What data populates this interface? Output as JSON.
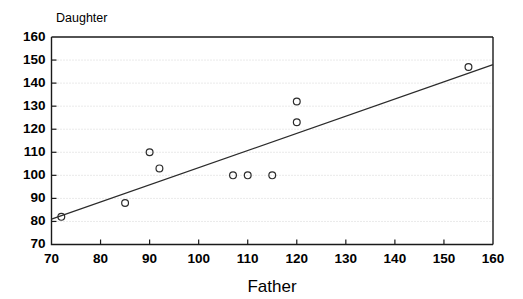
{
  "chart_data": {
    "type": "scatter",
    "title": "",
    "xlabel": "Father",
    "ylabel": "Daughter",
    "xlim": [
      70,
      160
    ],
    "ylim": [
      70,
      160
    ],
    "xticks": [
      70,
      80,
      90,
      100,
      110,
      120,
      130,
      140,
      150,
      160
    ],
    "yticks": [
      70,
      80,
      90,
      100,
      110,
      120,
      130,
      140,
      150,
      160
    ],
    "xtick_labels": [
      "70",
      "80",
      "90",
      "100",
      "110",
      "120",
      "130",
      "140",
      "150",
      "160"
    ],
    "ytick_labels": [
      "70",
      "80",
      "90",
      "100",
      "110",
      "120",
      "130",
      "140",
      "150",
      "160"
    ],
    "grid": "horizontal",
    "legend": "none",
    "marker": "open-circle",
    "marker_color": "#2b2b2b",
    "line_color": "#2b2b2b",
    "x": [
      72,
      85,
      90,
      92,
      107,
      110,
      115,
      120,
      120,
      155
    ],
    "y": [
      82,
      88,
      110,
      103,
      100,
      100,
      100,
      132,
      123,
      147
    ],
    "points": [
      {
        "x": 72,
        "y": 82
      },
      {
        "x": 85,
        "y": 88
      },
      {
        "x": 90,
        "y": 110
      },
      {
        "x": 92,
        "y": 103
      },
      {
        "x": 107,
        "y": 100
      },
      {
        "x": 110,
        "y": 100
      },
      {
        "x": 115,
        "y": 100
      },
      {
        "x": 120,
        "y": 132
      },
      {
        "x": 120,
        "y": 123
      },
      {
        "x": 155,
        "y": 147
      }
    ],
    "trendline": {
      "type": "linear",
      "x_start": 70,
      "y_start": 81,
      "x_end": 160,
      "y_end": 148
    }
  }
}
